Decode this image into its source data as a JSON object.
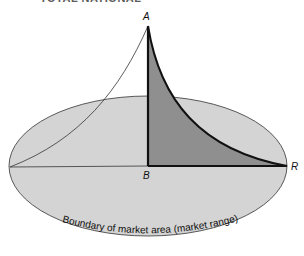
{
  "figure": {
    "title_partial": "TOTAL NATIONAL",
    "points": {
      "A": "A",
      "B": "B",
      "R": "R"
    },
    "caption": "Boundary of market area (market range)",
    "colors": {
      "ellipse_fill": "#d4d4d4",
      "triangle_fill": "#8f8f8f",
      "outline": "#111111",
      "background": "#ffffff"
    }
  }
}
